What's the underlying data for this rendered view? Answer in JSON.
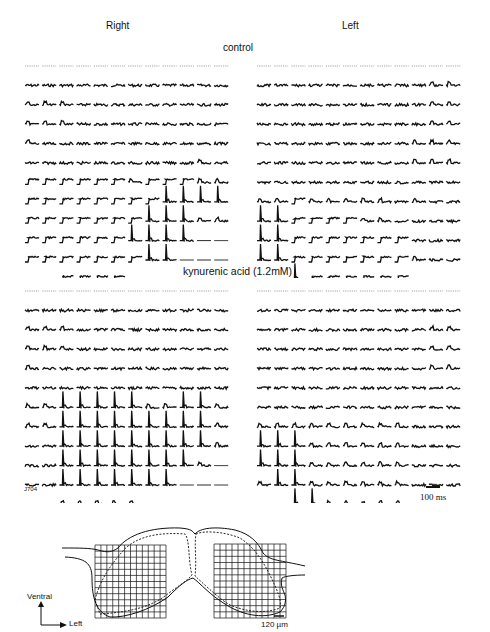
{
  "header": {
    "right_label": "Right",
    "left_label": "Left"
  },
  "sections": [
    {
      "title": "control",
      "right_panel": [
        "000000000000",
        "111111111111",
        "222111111111",
        "222111111111",
        "211111111111",
        "111111111121",
        "333333233322",
        "333333334444",
        "333333344422",
        "333333444455",
        "333333344555",
        "003333555000"
      ],
      "left_panel": [
        "000000000000",
        "111111111122",
        "111111111122",
        "111111111122",
        "111111111222",
        "111111111222",
        "111111111111",
        "223222221211",
        "443333221111",
        "443333333111",
        "443333333211",
        "0043333330000"
      ]
    },
    {
      "title": "kynurenic acid (1.2mM)",
      "right_panel": [
        "000000000000",
        "111111111111",
        "222111111111",
        "222111111111",
        "211111111111",
        "111111111111",
        "224444422442",
        "224444444442",
        "114444444442",
        "114444444425",
        "114444444555",
        "002222255000"
      ],
      "left_panel": [
        "000000000000",
        "111111111111",
        "111111111122",
        "111111111122",
        "111111111122",
        "111111111111",
        "111111111111",
        "222222222111",
        "444222222111",
        "444222222111",
        "244222222111",
        "004422222000"
      ]
    }
  ],
  "annotations": {
    "experiment_id": "J704",
    "time_scale": "100 ms",
    "spatial_scale": "120 µm",
    "orientation_up": "Ventral",
    "orientation_right": "Left"
  },
  "diagram": {
    "grid_cols": 12,
    "grid_rows": 12
  },
  "colors": {
    "ink": "#111111",
    "dashed": "#8a8a8a",
    "background": "#ffffff"
  }
}
